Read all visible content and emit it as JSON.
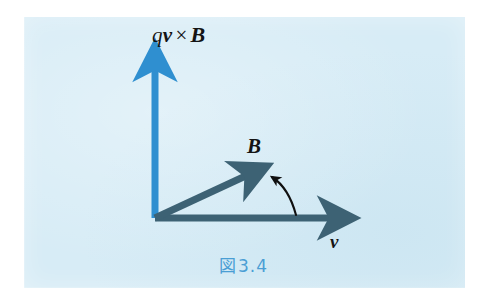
{
  "figure": {
    "caption": "図3.4",
    "caption_kanji": "図",
    "caption_number": "3.4",
    "caption_color": "#4a9ed4",
    "panel_color": "#d7ecf6",
    "page_background": "#ffffff"
  },
  "labels": {
    "vertical_axis": {
      "text": "qv × B",
      "q": "q",
      "v": "v",
      "times": "×",
      "B": "B",
      "color": "#141414"
    },
    "b_vector": {
      "text": "B",
      "color": "#141414"
    },
    "horizontal_axis": {
      "text": "v",
      "color": "#141414"
    }
  },
  "vectors": [
    {
      "name": "qv-cross-B-axis",
      "label": "qv × B",
      "from": [
        155,
        218
      ],
      "to": [
        155,
        56
      ],
      "color": "#2f8fd0",
      "width": 7,
      "style": "solid-arrow"
    },
    {
      "name": "v-axis",
      "label": "v",
      "from": [
        155,
        218
      ],
      "to": [
        358,
        218
      ],
      "color": "#3d6274",
      "width": 7,
      "style": "solid-arrow"
    },
    {
      "name": "B-vector",
      "label": "B",
      "from": [
        155,
        218
      ],
      "to": [
        262,
        168
      ],
      "color": "#3d6274",
      "width": 7,
      "style": "solid-arrow"
    },
    {
      "name": "angle-pointer",
      "label": "",
      "from": [
        296,
        214
      ],
      "to": [
        267,
        173
      ],
      "color": "#101010",
      "width": 2,
      "style": "curved-arrow"
    }
  ],
  "geometry": {
    "origin": [
      155,
      218
    ],
    "panel": {
      "x": 24,
      "y": 17,
      "width": 441,
      "height": 271
    }
  }
}
